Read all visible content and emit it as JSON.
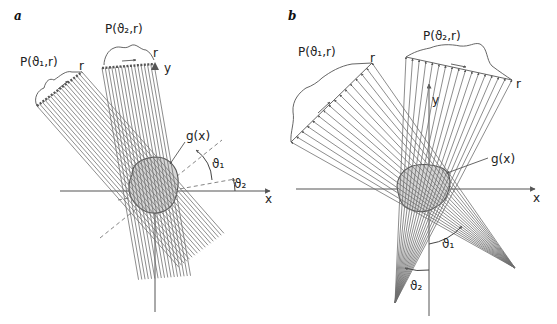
{
  "figure": {
    "panel_a": {
      "label": "a",
      "projection_1": "P(ϑ₁,r)",
      "projection_2": "P(ϑ₂,r)",
      "r_label_1": "r",
      "r_label_2": "r",
      "y_axis": "y",
      "x_axis": "x",
      "object": "g(x)",
      "angle_1": "ϑ₁",
      "angle_2": "ϑ₂",
      "beam_type": "parallel"
    },
    "panel_b": {
      "label": "b",
      "projection_1": "P(ϑ₁,r)",
      "projection_2": "P(ϑ₂,r)",
      "r_label_1": "r",
      "r_label_2": "r",
      "y_axis": "y",
      "x_axis": "x",
      "object": "g(x)",
      "angle_1": "ϑ₁",
      "angle_2": "ϑ₂",
      "beam_type": "fan"
    },
    "colors": {
      "line": "#6a6a6a",
      "axis": "#555555",
      "object_fill": "#d0d0d0",
      "object_stroke": "#555555"
    }
  }
}
